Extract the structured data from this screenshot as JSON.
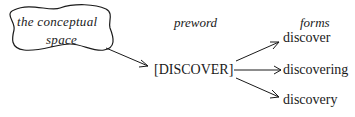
{
  "diagram": {
    "concept": {
      "line1": "the conceptual",
      "line2": "space"
    },
    "headers": {
      "preword": "preword",
      "forms": "forms"
    },
    "preword": "[DISCOVER]",
    "forms": [
      "discover",
      "discovering",
      "discovery"
    ]
  }
}
